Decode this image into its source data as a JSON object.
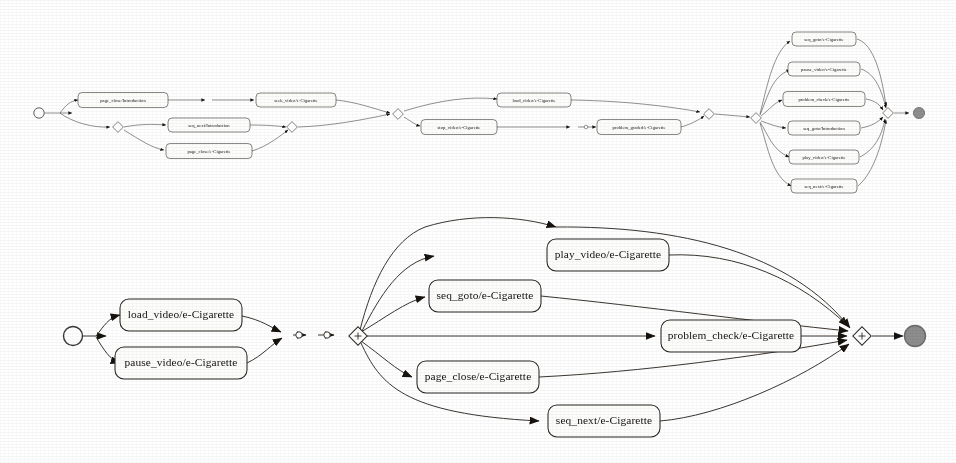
{
  "document": {
    "title": "Process model comparison: Introduction and e-Cigarette event flows",
    "background_color": "#ffffff",
    "node_fill": "#fdfdfc",
    "stroke_color": "#2a2622",
    "end_node_color": "#8d8d8d",
    "start_node_color": "#ffffff"
  },
  "diagrams": [
    {
      "id": "top-model",
      "name": "top-process-model",
      "scale": "small",
      "start_label": "start",
      "end_label": "end",
      "gateway_glyph": "+",
      "nodes": [
        {
          "id": "t1",
          "label": "page_close/Introduction",
          "x": 123,
          "y": 100,
          "w": 90,
          "h": 15
        },
        {
          "id": "t2",
          "label": "seq_next/Introduction",
          "x": 209,
          "y": 125,
          "w": 82,
          "h": 14
        },
        {
          "id": "t3",
          "label": "page_close/e-Cigarette",
          "x": 209,
          "y": 151,
          "w": 86,
          "h": 15
        },
        {
          "id": "t4",
          "label": "seek_video/e-Cigarette",
          "x": 296,
          "y": 100,
          "w": 80,
          "h": 14
        },
        {
          "id": "t5",
          "label": "load_video/e-Cigarette",
          "x": 534,
          "y": 100,
          "w": 74,
          "h": 14
        },
        {
          "id": "t6",
          "label": "stop_video/e-Cigarette",
          "x": 459,
          "y": 127,
          "w": 76,
          "h": 15
        },
        {
          "id": "t7",
          "label": "problem_graded/e-Cigarette",
          "x": 639,
          "y": 127,
          "w": 84,
          "h": 15
        },
        {
          "id": "t8",
          "label": "seq_goto/e-Cigarette",
          "x": 824,
          "y": 39,
          "w": 64,
          "h": 14
        },
        {
          "id": "t9",
          "label": "pause_video/e-Cigarette",
          "x": 824,
          "y": 69,
          "w": 72,
          "h": 14
        },
        {
          "id": "t10",
          "label": "problem_check/e-Cigarette",
          "x": 824,
          "y": 99,
          "w": 82,
          "h": 15
        },
        {
          "id": "t11",
          "label": "seq_goto/Introduction",
          "x": 824,
          "y": 128,
          "w": 72,
          "h": 14
        },
        {
          "id": "t12",
          "label": "play_video/e-Cigarette",
          "x": 824,
          "y": 157,
          "w": 70,
          "h": 14
        },
        {
          "id": "t13",
          "label": "seq_next/e-Cigarette",
          "x": 824,
          "y": 186,
          "w": 66,
          "h": 14
        }
      ]
    },
    {
      "id": "bottom-model",
      "name": "bottom-process-model",
      "scale": "large",
      "start_label": "start",
      "end_label": "end",
      "gateway_glyph": "+",
      "nodes": [
        {
          "id": "b1",
          "label": "load_video/e-Cigarette",
          "x": 181,
          "y": 315,
          "w": 122,
          "h": 32
        },
        {
          "id": "b2",
          "label": "pause_video/e-Cigarette",
          "x": 181,
          "y": 363,
          "w": 132,
          "h": 32
        },
        {
          "id": "b3",
          "label": "play_video/e-Cigarette",
          "x": 608,
          "y": 255,
          "w": 122,
          "h": 32
        },
        {
          "id": "b4",
          "label": "seq_goto/e-Cigarette",
          "x": 485,
          "y": 296,
          "w": 112,
          "h": 32
        },
        {
          "id": "b5",
          "label": "problem_check/e-Cigarette",
          "x": 731,
          "y": 336,
          "w": 140,
          "h": 32
        },
        {
          "id": "b6",
          "label": "page_close/e-Cigarette",
          "x": 478,
          "y": 377,
          "w": 122,
          "h": 32
        },
        {
          "id": "b7",
          "label": "seq_next/e-Cigarette",
          "x": 604,
          "y": 421,
          "w": 112,
          "h": 32
        }
      ]
    }
  ],
  "legend": {
    "start_marker": "open-circle",
    "end_marker": "filled-circle",
    "gateway_marker": "diamond-plus",
    "arrow_marker": "filled-triangle"
  }
}
